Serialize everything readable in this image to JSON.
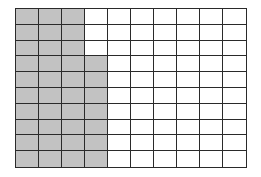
{
  "diagram": {
    "type": "hundred-grid",
    "rows": 10,
    "columns": 10,
    "total_cells": 100,
    "shaded_cells": 37,
    "shaded_per_row": [
      3,
      3,
      3,
      4,
      4,
      4,
      4,
      4,
      4,
      4
    ],
    "colors": {
      "shaded": "#c2c2c2",
      "unshaded": "#ffffff",
      "grid_line": "#2a2a2a"
    }
  }
}
